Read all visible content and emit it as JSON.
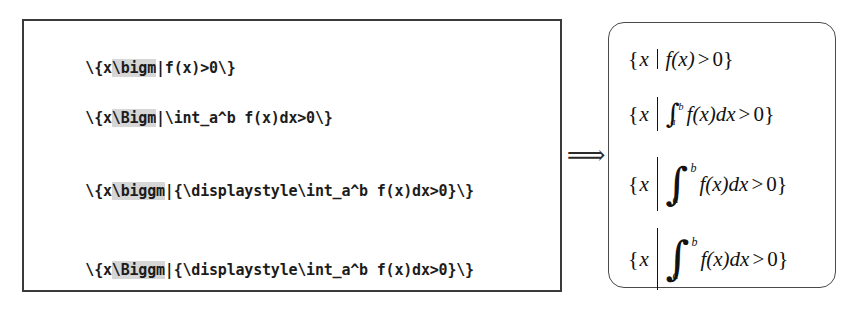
{
  "figure": {
    "kind": "latex-source-to-rendered-output",
    "arrow_symbol": "⟹"
  },
  "source_panel": {
    "lines": [
      {
        "prefix": "\\{x",
        "macro": "\\bigm",
        "suffix": "|f(x)>0\\}"
      },
      {
        "prefix": "\\{x",
        "macro": "\\Bigm",
        "suffix": "|\\int_a^b f(x)dx>0\\}"
      },
      {
        "prefix": "\\{x",
        "macro": "\\biggm",
        "suffix": "|{\\displaystyle\\int_a^b f(x)dx>0}\\}"
      },
      {
        "prefix": "\\{x",
        "macro": "\\Biggm",
        "suffix": "|{\\displaystyle\\int_a^b f(x)dx>0}\\}"
      }
    ],
    "highlight_color": "#d6d6d6",
    "border_color": "#3a3a3a",
    "text_color": "#1c1c1c"
  },
  "render_panel": {
    "border_color": "#4a4a4a",
    "text_color": "#121212",
    "rows": [
      {
        "brace_open": "{",
        "variable": "x",
        "delimiter_size": "\\bigm",
        "integral": null,
        "expression": "f(x)",
        "relation": ">",
        "value": "0",
        "brace_close": "}"
      },
      {
        "brace_open": "{",
        "variable": "x",
        "delimiter_size": "\\Bigm",
        "integral": {
          "sign": "∫",
          "lower": "a",
          "upper": "b",
          "style": "inline"
        },
        "expression": "f(x)dx",
        "relation": ">",
        "value": "0",
        "brace_close": "}"
      },
      {
        "brace_open": "{",
        "variable": "x",
        "delimiter_size": "\\biggm",
        "integral": {
          "sign": "∫",
          "lower": "a",
          "upper": "b",
          "style": "display"
        },
        "expression": "f(x)dx",
        "relation": ">",
        "value": "0",
        "brace_close": "}"
      },
      {
        "brace_open": "{",
        "variable": "x",
        "delimiter_size": "\\Biggm",
        "integral": {
          "sign": "∫",
          "lower": "a",
          "upper": "b",
          "style": "display"
        },
        "expression": "f(x)dx",
        "relation": ">",
        "value": "0",
        "brace_close": "}"
      }
    ]
  }
}
